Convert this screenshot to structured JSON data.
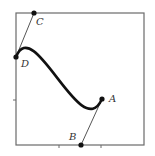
{
  "diagram": {
    "type": "cubic-bezier-curve",
    "frame": {
      "x": 16,
      "y": 13,
      "width": 128,
      "height": 132
    },
    "ticks": {
      "bottom": [
        59,
        101
      ],
      "left": [
        100
      ]
    },
    "points": {
      "A": {
        "label": "A",
        "x": 102,
        "y": 99,
        "label_x": 109,
        "label_y": 102
      },
      "B": {
        "label": "B",
        "x": 81,
        "y": 145,
        "label_x": 69,
        "label_y": 140
      },
      "C": {
        "label": "C",
        "x": 34,
        "y": 13,
        "label_x": 36,
        "label_y": 25
      },
      "D": {
        "label": "D",
        "x": 16,
        "y": 57,
        "label_x": 21,
        "label_y": 67
      }
    },
    "curve": {
      "start": "D",
      "control1": "C",
      "control2": "B",
      "end": "A"
    },
    "handles": [
      [
        "D",
        "C"
      ],
      [
        "A",
        "B"
      ]
    ],
    "colors": {
      "curve": "#111111",
      "frame": "#6a6a6a",
      "handle": "#555555",
      "label": "#333333"
    }
  }
}
